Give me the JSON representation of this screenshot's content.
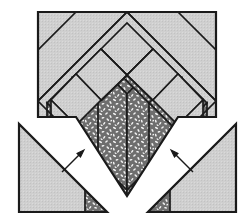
{
  "figure": {
    "canvas": {
      "width": 251,
      "height": 222
    },
    "colors": {
      "background": "#ffffff",
      "plain_fill": "#cfcfcf",
      "textured_base": "#6e6e6e",
      "textured_speck": "#f2f2f2",
      "outline": "#1a1a1a",
      "arrow": "#1a1a1a"
    },
    "stroke_widths": {
      "outer": 2.2,
      "inner": 1.7,
      "arrow": 1.4
    }
  },
  "shapes": {
    "main_square": {
      "label": "main-block-square",
      "corners": [
        [
          38,
          12
        ],
        [
          216,
          12
        ],
        [
          216,
          117
        ],
        [
          38,
          117
        ]
      ],
      "fill": "plain"
    },
    "diamond": {
      "label": "rotated-diamond",
      "center": [
        127,
        58
      ],
      "top": [
        127,
        12
      ],
      "left": [
        38,
        101
      ],
      "right": [
        216,
        101
      ],
      "bottom": [
        127,
        196
      ]
    },
    "left_triangle": {
      "label": "left-corner-triangle",
      "points": [
        [
          19,
          124
        ],
        [
          19,
          212
        ],
        [
          107,
          212
        ]
      ],
      "fill": "plain"
    },
    "right_triangle": {
      "label": "right-corner-triangle",
      "points": [
        [
          236,
          124
        ],
        [
          236,
          212
        ],
        [
          148,
          212
        ]
      ],
      "fill": "plain"
    },
    "left_triangle_tip": {
      "label": "left-triangle-textured-tip",
      "points": [
        [
          85,
          190
        ],
        [
          107,
          212
        ],
        [
          85,
          212
        ]
      ],
      "fill": "textured"
    },
    "right_triangle_tip": {
      "label": "right-triangle-textured-tip",
      "points": [
        [
          170,
          190
        ],
        [
          148,
          212
        ],
        [
          170,
          212
        ]
      ],
      "fill": "textured"
    }
  },
  "chevrons": [
    {
      "name": "chevron-center-inner",
      "fill": "textured"
    },
    {
      "name": "chevron-center-outer",
      "fill": "textured"
    },
    {
      "name": "chevron-left-inner",
      "fill": "textured"
    },
    {
      "name": "chevron-left-outer",
      "fill": "textured"
    },
    {
      "name": "chevron-right-inner",
      "fill": "textured"
    },
    {
      "name": "chevron-right-outer",
      "fill": "textured"
    },
    {
      "name": "chevron-plain-left",
      "fill": "plain"
    },
    {
      "name": "chevron-plain-right",
      "fill": "plain"
    }
  ],
  "arrows": [
    {
      "name": "left-insertion-arrow",
      "direction": "up-right",
      "tail": [
        62,
        172
      ],
      "head": [
        84,
        150
      ]
    },
    {
      "name": "right-insertion-arrow",
      "direction": "up-left",
      "tail": [
        193,
        172
      ],
      "head": [
        171,
        150
      ]
    }
  ],
  "notch": {
    "name": "v-notch-gap",
    "description": "White V shaped gap separating the flanking triangles from the diamond block"
  }
}
